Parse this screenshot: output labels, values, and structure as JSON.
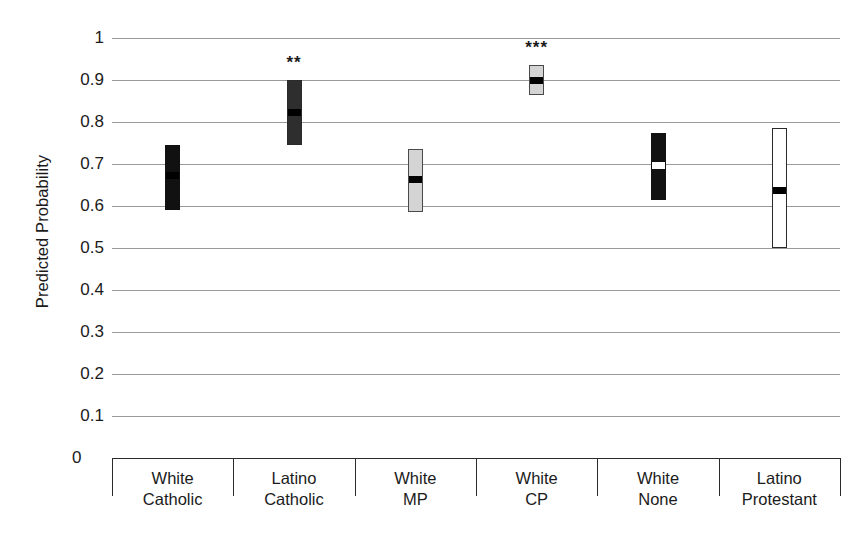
{
  "chart_data": {
    "type": "bar",
    "subtype": "confidence-interval-plot",
    "title": "",
    "xlabel": "",
    "ylabel": "Predicted Probability",
    "ylim": [
      0,
      1
    ],
    "ytick_labels": [
      "1",
      "0.9",
      "0.8",
      "0.7",
      "0.6",
      "0.5",
      "0.4",
      "0.3",
      "0.2",
      "0.1",
      "0"
    ],
    "ytick_values": [
      1,
      0.9,
      0.8,
      0.7,
      0.6,
      0.5,
      0.4,
      0.3,
      0.2,
      0.1,
      0
    ],
    "grid": true,
    "legend": "none",
    "categories": [
      "White Catholic",
      "Latino Catholic",
      "White MP",
      "White CP",
      "White None",
      "Latino Protestant"
    ],
    "category_lines": [
      [
        "White",
        "Catholic"
      ],
      [
        "Latino",
        "Catholic"
      ],
      [
        "White",
        "MP"
      ],
      [
        "White",
        "CP"
      ],
      [
        "White",
        "None"
      ],
      [
        "Latino",
        "Protestant"
      ]
    ],
    "values": [
      0.675,
      0.825,
      0.665,
      0.9,
      0.7,
      0.64
    ],
    "ci_low": [
      0.59,
      0.745,
      0.585,
      0.865,
      0.615,
      0.5
    ],
    "ci_high": [
      0.745,
      0.9,
      0.735,
      0.935,
      0.775,
      0.785
    ],
    "bar_styles": [
      "dark",
      "darkgy",
      "light",
      "light",
      "dark",
      "white"
    ],
    "point_styles": [
      "black",
      "black",
      "black",
      "black",
      "white",
      "black"
    ],
    "significance": [
      "",
      "**",
      "",
      "***",
      "",
      ""
    ],
    "bar_fill_colors": [
      "#111111",
      "#2e2e2e",
      "#d4d4d4",
      "#d4d4d4",
      "#111111",
      "#ffffff"
    ],
    "gridline_color": "#9a9a9a",
    "axis_color": "#2b2b2b",
    "text_color": "#1b1b1b"
  }
}
